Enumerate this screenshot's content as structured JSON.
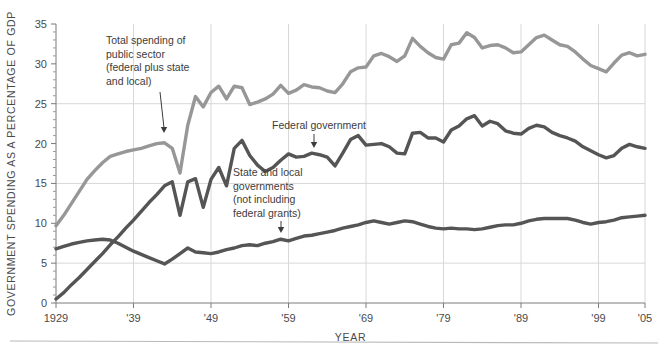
{
  "chart_data": {
    "type": "line",
    "title": "",
    "xlabel": "YEAR",
    "ylabel": "GOVERNMENT SPENDING AS A PERCENTAGE OF GDP",
    "xlim": [
      1929,
      2005
    ],
    "ylim": [
      0,
      35
    ],
    "grid": true,
    "legend_position": "inline-annotations",
    "y_ticks": [
      0,
      5,
      10,
      15,
      20,
      25,
      30,
      35
    ],
    "y_tick_labels": [
      "0",
      "5",
      "10",
      "15",
      "20",
      "25",
      "30",
      "35"
    ],
    "x_ticks": [
      1929,
      1939,
      1949,
      1959,
      1969,
      1979,
      1989,
      1999,
      2005
    ],
    "x_tick_labels": [
      "1929",
      "'39",
      "'49",
      "'59",
      "'69",
      "'79",
      "'89",
      "'99",
      "'05"
    ],
    "x_gridlines": [
      1939,
      1949,
      1959,
      1969,
      1979,
      1989,
      1999,
      2005
    ],
    "y_gridlines": [
      5,
      15,
      25
    ],
    "colors": {
      "total": "#979797",
      "federal": "#555555",
      "state_local": "#555555",
      "grid": "#d8d8d8",
      "axis": "#7a7a7a",
      "text": "#3c3c3c"
    },
    "series": [
      {
        "name": "Total spending of public sector (federal plus state and local)",
        "key": "total",
        "color": "#979797",
        "x": [
          1929,
          1930,
          1931,
          1932,
          1933,
          1934,
          1935,
          1936,
          1937,
          1938,
          1939,
          1940,
          1941,
          1942,
          1943,
          1944,
          1945,
          1946,
          1947,
          1948,
          1949,
          1950,
          1951,
          1952,
          1953,
          1954,
          1955,
          1956,
          1957,
          1958,
          1959,
          1960,
          1961,
          1962,
          1963,
          1964,
          1965,
          1966,
          1967,
          1968,
          1969,
          1970,
          1971,
          1972,
          1973,
          1974,
          1975,
          1976,
          1977,
          1978,
          1979,
          1980,
          1981,
          1982,
          1983,
          1984,
          1985,
          1986,
          1987,
          1988,
          1989,
          1990,
          1991,
          1992,
          1993,
          1994,
          1995,
          1996,
          1997,
          1998,
          1999,
          2000,
          2001,
          2002,
          2003,
          2004,
          2005
        ],
        "y": [
          9.7,
          11.0,
          12.5,
          14.0,
          15.5,
          16.6,
          17.6,
          18.4,
          18.7,
          19.0,
          19.2,
          19.4,
          19.7,
          20.0,
          20.1,
          19.4,
          16.3,
          22.3,
          25.9,
          24.6,
          26.4,
          27.2,
          25.6,
          27.2,
          27.0,
          24.9,
          25.2,
          25.6,
          26.2,
          27.3,
          26.3,
          26.7,
          27.4,
          27.1,
          27.0,
          26.6,
          26.4,
          27.5,
          29.0,
          29.5,
          29.6,
          31.0,
          31.3,
          30.9,
          30.3,
          31.0,
          33.2,
          32.2,
          31.4,
          30.8,
          30.6,
          32.4,
          32.6,
          33.9,
          33.3,
          32.0,
          32.3,
          32.4,
          32.0,
          31.4,
          31.5,
          32.4,
          33.3,
          33.6,
          33.0,
          32.4,
          32.2,
          31.5,
          30.6,
          29.8,
          29.4,
          29.0,
          30.1,
          31.1,
          31.4,
          31.0,
          31.2
        ]
      },
      {
        "name": "Federal government",
        "key": "federal",
        "color": "#555555",
        "x": [
          1929,
          1930,
          1931,
          1932,
          1933,
          1934,
          1935,
          1936,
          1937,
          1938,
          1939,
          1940,
          1941,
          1942,
          1943,
          1944,
          1945,
          1946,
          1947,
          1948,
          1949,
          1950,
          1951,
          1952,
          1953,
          1954,
          1955,
          1956,
          1957,
          1958,
          1959,
          1960,
          1961,
          1962,
          1963,
          1964,
          1965,
          1966,
          1967,
          1968,
          1969,
          1970,
          1971,
          1972,
          1973,
          1974,
          1975,
          1976,
          1977,
          1978,
          1979,
          1980,
          1981,
          1982,
          1983,
          1984,
          1985,
          1986,
          1987,
          1988,
          1989,
          1990,
          1991,
          1992,
          1993,
          1994,
          1995,
          1996,
          1997,
          1998,
          1999,
          2000,
          2001,
          2002,
          2003,
          2004,
          2005
        ],
        "y": [
          0.5,
          1.3,
          2.3,
          3.2,
          4.2,
          5.2,
          6.2,
          7.3,
          8.3,
          9.4,
          10.4,
          11.5,
          12.6,
          13.6,
          14.7,
          15.2,
          11.0,
          15.2,
          15.6,
          12.0,
          15.5,
          17.0,
          14.7,
          19.4,
          20.4,
          18.5,
          17.3,
          16.5,
          17.0,
          17.9,
          18.7,
          18.3,
          18.4,
          18.8,
          18.6,
          18.3,
          17.2,
          18.8,
          20.5,
          21.0,
          19.8,
          19.9,
          20.0,
          19.6,
          18.8,
          18.7,
          21.3,
          21.4,
          20.7,
          20.7,
          20.2,
          21.7,
          22.2,
          23.1,
          23.5,
          22.2,
          22.8,
          22.5,
          21.6,
          21.3,
          21.2,
          21.9,
          22.3,
          22.1,
          21.4,
          21.0,
          20.7,
          20.3,
          19.6,
          19.1,
          18.6,
          18.2,
          18.5,
          19.4,
          19.9,
          19.6,
          19.4
        ]
      },
      {
        "name": "State and local governments (not including federal grants)",
        "key": "state_local",
        "color": "#555555",
        "x": [
          1929,
          1930,
          1931,
          1932,
          1933,
          1934,
          1935,
          1936,
          1937,
          1938,
          1939,
          1940,
          1941,
          1942,
          1943,
          1944,
          1945,
          1946,
          1947,
          1948,
          1949,
          1950,
          1951,
          1952,
          1953,
          1954,
          1955,
          1956,
          1957,
          1958,
          1959,
          1960,
          1961,
          1962,
          1963,
          1964,
          1965,
          1966,
          1967,
          1968,
          1969,
          1970,
          1971,
          1972,
          1973,
          1974,
          1975,
          1976,
          1977,
          1978,
          1979,
          1980,
          1981,
          1982,
          1983,
          1984,
          1985,
          1986,
          1987,
          1988,
          1989,
          1990,
          1991,
          1992,
          1993,
          1994,
          1995,
          1996,
          1997,
          1998,
          1999,
          2000,
          2001,
          2002,
          2003,
          2004,
          2005
        ],
        "y": [
          6.8,
          7.1,
          7.4,
          7.6,
          7.8,
          7.9,
          8.0,
          7.9,
          7.5,
          7.0,
          6.5,
          6.1,
          5.7,
          5.3,
          4.9,
          5.5,
          6.2,
          6.9,
          6.4,
          6.3,
          6.2,
          6.4,
          6.7,
          6.9,
          7.2,
          7.3,
          7.2,
          7.5,
          7.7,
          8.0,
          7.8,
          8.1,
          8.4,
          8.5,
          8.7,
          8.9,
          9.1,
          9.4,
          9.6,
          9.8,
          10.1,
          10.3,
          10.1,
          9.9,
          10.1,
          10.3,
          10.2,
          9.9,
          9.6,
          9.4,
          9.3,
          9.4,
          9.3,
          9.3,
          9.2,
          9.3,
          9.5,
          9.7,
          9.8,
          9.8,
          10.0,
          10.3,
          10.5,
          10.6,
          10.6,
          10.6,
          10.6,
          10.4,
          10.1,
          9.9,
          10.1,
          10.2,
          10.4,
          10.7,
          10.8,
          10.9,
          11.0
        ]
      }
    ],
    "annotations": [
      {
        "id": "annotation-total",
        "lines": [
          "Total spending of",
          "public sector",
          "(federal plus state",
          "and local)"
        ],
        "text_x": 106,
        "text_y": 44,
        "leader": {
          "x1": 160,
          "y1": 92,
          "x2": 164,
          "y2": 133
        },
        "arrow": "down"
      },
      {
        "id": "annotation-federal",
        "lines": [
          "Federal government"
        ],
        "text_x": 272,
        "text_y": 129,
        "leader": {
          "x1": 314,
          "y1": 134,
          "x2": 314,
          "y2": 148
        },
        "arrow": "down"
      },
      {
        "id": "annotation-state-local",
        "lines": [
          "State and local",
          "governments",
          "(not including",
          "federal grants)"
        ],
        "text_x": 233,
        "text_y": 176,
        "leader": {
          "x1": 281,
          "y1": 221,
          "x2": 281,
          "y2": 233
        },
        "arrow": "down"
      }
    ]
  }
}
